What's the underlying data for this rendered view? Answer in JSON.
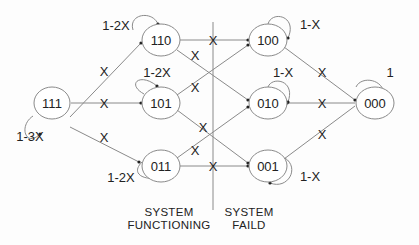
{
  "diagram": {
    "type": "state-transition-diagram",
    "nodes": [
      {
        "id": "111",
        "label": "111",
        "self_loop": "1-3X"
      },
      {
        "id": "110",
        "label": "110",
        "self_loop": "1-2X"
      },
      {
        "id": "101",
        "label": "101",
        "self_loop": "1-2X"
      },
      {
        "id": "011",
        "label": "011",
        "self_loop": "1-2X"
      },
      {
        "id": "100",
        "label": "100",
        "self_loop": "1-X"
      },
      {
        "id": "010",
        "label": "010",
        "self_loop": "1-X"
      },
      {
        "id": "001",
        "label": "001",
        "self_loop": "1-X"
      },
      {
        "id": "000",
        "label": "000",
        "self_loop": "1"
      }
    ],
    "edges": [
      {
        "from": "111",
        "to": "110",
        "label": "X"
      },
      {
        "from": "111",
        "to": "101",
        "label": "X"
      },
      {
        "from": "111",
        "to": "011",
        "label": "X"
      },
      {
        "from": "110",
        "to": "100",
        "label": "X"
      },
      {
        "from": "110",
        "to": "010",
        "label": "X"
      },
      {
        "from": "101",
        "to": "100",
        "label": "X"
      },
      {
        "from": "101",
        "to": "001",
        "label": "X"
      },
      {
        "from": "011",
        "to": "010",
        "label": "X"
      },
      {
        "from": "011",
        "to": "001",
        "label": "X"
      },
      {
        "from": "100",
        "to": "000",
        "label": "X"
      },
      {
        "from": "010",
        "to": "000",
        "label": "X"
      },
      {
        "from": "001",
        "to": "000",
        "label": "X"
      }
    ],
    "regions": {
      "left": {
        "line1": "SYSTEM",
        "line2": "FUNCTIONING"
      },
      "right": {
        "line1": "SYSTEM",
        "line2": "FAILD"
      }
    },
    "colors": {
      "line": "#8a8a8a",
      "text": "#222222",
      "background": "#fdfdfd"
    }
  }
}
